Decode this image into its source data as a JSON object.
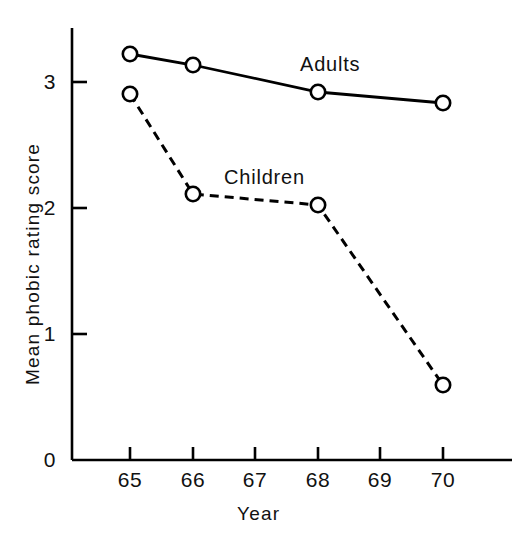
{
  "chart_data": {
    "type": "line",
    "title": "",
    "xlabel": "Year",
    "ylabel": "Mean phobic rating score",
    "x": [
      65,
      66,
      67,
      68,
      69,
      70
    ],
    "xtick_labels": [
      "65",
      "66",
      "67",
      "68",
      "69",
      "70"
    ],
    "ytick_labels": [
      "0",
      "1",
      "2",
      "3"
    ],
    "yticks": [
      0,
      1,
      2,
      3
    ],
    "xlim": [
      64.6,
      70.9
    ],
    "ylim": [
      0,
      3.45
    ],
    "grid": false,
    "legend_position": "inline-annotation",
    "series": [
      {
        "name": "Adults",
        "style": "solid",
        "marker": "open-circle",
        "x": [
          65,
          66,
          68,
          70
        ],
        "values": [
          3.2,
          3.1,
          2.9,
          2.8
        ],
        "label_text": "Adults"
      },
      {
        "name": "Children",
        "style": "dashed",
        "marker": "open-circle",
        "x": [
          65,
          66,
          68,
          70
        ],
        "values": [
          2.9,
          2.1,
          2.0,
          0.6
        ],
        "label_text": "Children"
      }
    ],
    "colors": {
      "line": "#000000",
      "axis": "#000000",
      "background": "#ffffff",
      "text": "#111111"
    }
  },
  "axes": {
    "y_title": "Mean phobic rating score",
    "x_title": "Year",
    "y_ticks": [
      {
        "label": "3"
      },
      {
        "label": "2"
      },
      {
        "label": "1"
      },
      {
        "label": "0"
      }
    ],
    "x_ticks": [
      {
        "label": "65"
      },
      {
        "label": "66"
      },
      {
        "label": "67"
      },
      {
        "label": "68"
      },
      {
        "label": "69"
      },
      {
        "label": "70"
      }
    ]
  },
  "annotations": {
    "adults": "Adults",
    "children": "Children"
  }
}
